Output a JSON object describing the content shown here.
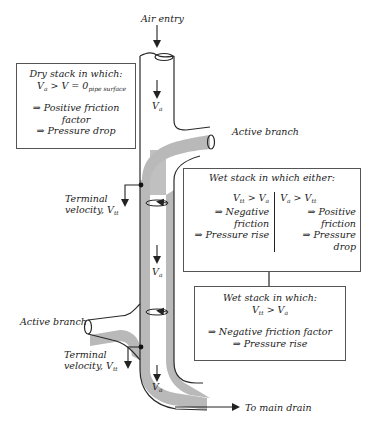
{
  "header": {
    "clipped_text": "... ... y ... ... ... g ... ... ... ... ppy ..."
  },
  "labels": {
    "air_entry": "Air entry",
    "active_branch_top": "Active branch",
    "active_branch_left": "Active branch",
    "terminal_velocity_1_line1": "Terminal",
    "terminal_velocity_1_line2": "velocity, V",
    "terminal_velocity_1_sub": "tt",
    "terminal_velocity_2_line1": "Terminal",
    "terminal_velocity_2_line2": "velocity, V",
    "terminal_velocity_2_sub": "tt",
    "va_1": "V",
    "va_1_sub": "a",
    "va_2": "V",
    "va_2_sub": "a",
    "va_3": "V",
    "va_3_sub": "a",
    "to_main_drain": "To main drain"
  },
  "boxes": {
    "dry_stack": {
      "title": "Dry stack in which:",
      "condition_main": "V",
      "condition_main_sub": "a",
      "condition_rest": " > V",
      "condition_rest_sub": "pipe surface",
      "condition_eq": " = 0",
      "result1": "⇒ Positive friction factor",
      "result2": "⇒ Pressure drop"
    },
    "wet_stack_either": {
      "title": "Wet stack in which either:",
      "left": {
        "condition": "V",
        "condition_sub1": "tt",
        "condition_mid": " > V",
        "condition_sub2": "a",
        "result1": "⇒ Negative friction",
        "result2": "⇒ Pressure rise"
      },
      "right": {
        "condition": "V",
        "condition_sub1": "a",
        "condition_mid": " > V",
        "condition_sub2": "tt",
        "result1": "⇒ Positive friction",
        "result2": "⇒ Pressure drop"
      }
    },
    "wet_stack": {
      "title": "Wet stack in which:",
      "condition": "V",
      "condition_sub1": "tt",
      "condition_mid": " > V",
      "condition_sub2": "a",
      "result1": "⇒ Negative friction factor",
      "result2": "⇒ Pressure rise"
    }
  },
  "colors": {
    "pipe_outline": "#2a2a2a",
    "water_film": "#b9b9b9",
    "box_border": "#555555",
    "text": "#222222"
  }
}
